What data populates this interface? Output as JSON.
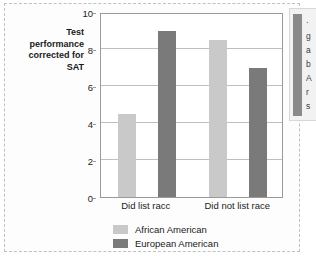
{
  "chart_data": {
    "type": "bar",
    "title": "",
    "xlabel": "",
    "ylabel": "Test performance corrected for SAT",
    "categories": [
      "Did list racc",
      "Did not list race"
    ],
    "series": [
      {
        "name": "African American",
        "color": "#c9c9c9",
        "values": [
          4.5,
          8.5
        ]
      },
      {
        "name": "European American",
        "color": "#7a7a7a",
        "values": [
          9.0,
          7.0
        ]
      }
    ],
    "ylim": [
      0,
      10
    ],
    "ytick_values": [
      0,
      2,
      4,
      6,
      8,
      10
    ],
    "ytick_labels": [
      "0",
      "2",
      "4",
      "6",
      "8",
      "10"
    ],
    "grid": true,
    "legend_position": "bottom-center"
  },
  "axis_caption": {
    "line1": "Test",
    "line2": "performance",
    "line3": "corrected for",
    "line4": "SAT"
  },
  "side_panel": {
    "clipped_lines": [
      "·",
      "g",
      "a",
      "b",
      "A",
      "r",
      "s"
    ]
  }
}
